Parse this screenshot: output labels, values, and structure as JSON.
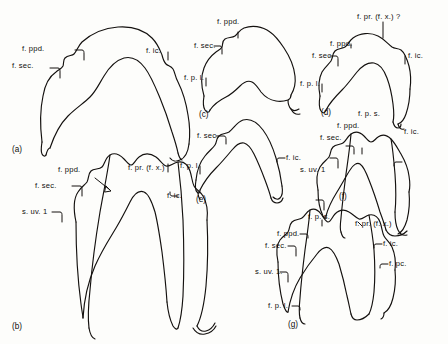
{
  "figure": {
    "background_color": "#fdfdfb",
    "ink_color": "#14110f",
    "panel_count": 7
  },
  "panels": [
    {
      "id": "a",
      "id_label": "(a)",
      "labels": [
        {
          "key": "f_ppd",
          "text": "f. ppd."
        },
        {
          "key": "f_sec",
          "text": "f. sec."
        },
        {
          "key": "f_ic",
          "text": "f. ic."
        }
      ]
    },
    {
      "id": "b",
      "id_label": "(b)",
      "labels": [
        {
          "key": "f_ppd",
          "text": "f. ppd."
        },
        {
          "key": "f_pr",
          "text": "f. pr. (f. x.)"
        },
        {
          "key": "f_sec",
          "text": "f. sec."
        },
        {
          "key": "f_ic",
          "text": "f. ic."
        },
        {
          "key": "s_uv",
          "text": "s. uv. 1"
        }
      ]
    },
    {
      "id": "c",
      "id_label": "(c)",
      "labels": [
        {
          "key": "f_ppd",
          "text": "f. ppd."
        },
        {
          "key": "f_sec",
          "text": "f. sec."
        },
        {
          "key": "f_pl",
          "text": "f. p. l."
        }
      ]
    },
    {
      "id": "d",
      "id_label": "(d)",
      "labels": [
        {
          "key": "f_pr",
          "text": "f. pr. (f. x.) ?"
        },
        {
          "key": "f_ppd",
          "text": "f. ppd."
        },
        {
          "key": "f_sec",
          "text": "f. sec."
        },
        {
          "key": "f_pl",
          "text": "f. p. l."
        },
        {
          "key": "f_ic",
          "text": "f. ic."
        }
      ]
    },
    {
      "id": "e",
      "id_label": "(e)",
      "labels": [
        {
          "key": "f_sec",
          "text": "f. sec."
        },
        {
          "key": "f_pl",
          "text": "f. p. l."
        },
        {
          "key": "f_ic",
          "text": "f. ic."
        }
      ]
    },
    {
      "id": "f",
      "id_label": "(f)",
      "labels": [
        {
          "key": "f_ps",
          "text": "f. p. s."
        },
        {
          "key": "f_ppd",
          "text": "f. ppd."
        },
        {
          "key": "f_sec",
          "text": "f. sec."
        },
        {
          "key": "f_ic",
          "text": "f. ic."
        },
        {
          "key": "s_uv",
          "text": "s. uv. 1"
        }
      ]
    },
    {
      "id": "g",
      "id_label": "(g)",
      "labels": [
        {
          "key": "f_ps",
          "text": "f. p. s."
        },
        {
          "key": "f_pr",
          "text": "f. pr. (f. x.)"
        },
        {
          "key": "f_ppd",
          "text": "f. ppd."
        },
        {
          "key": "f_sec",
          "text": "f. sec."
        },
        {
          "key": "f_ic",
          "text": "f. ic."
        },
        {
          "key": "f_pc",
          "text": "f. pc."
        },
        {
          "key": "s_uv",
          "text": "s. uv. 1."
        },
        {
          "key": "f_pl",
          "text": "f. p. l."
        }
      ]
    }
  ]
}
